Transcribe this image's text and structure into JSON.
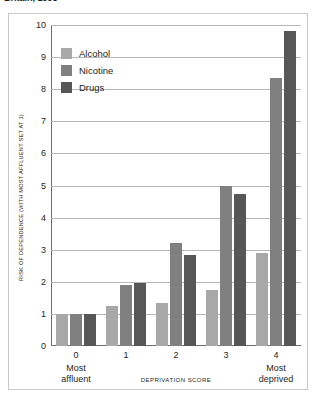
{
  "caption": {
    "text": "Britain, 1998"
  },
  "legend": {
    "position": "top-left-inside",
    "items": [
      {
        "label": "Alcohol",
        "color": "#a8a8a8",
        "icon": "square-swatch-icon"
      },
      {
        "label": "Nicotine",
        "color": "#808080",
        "icon": "square-swatch-icon"
      },
      {
        "label": "Drugs",
        "color": "#575757",
        "icon": "square-swatch-icon"
      }
    ]
  },
  "axes": {
    "y_title": "RISK OF DEPENDENCE (WITH MOST AFFLUENT SET AT 1)",
    "x_title": "DEPRIVATION SCORE",
    "y_ticks": [
      "0",
      "1",
      "2",
      "3",
      "4",
      "5",
      "6",
      "7",
      "8",
      "9",
      "10"
    ],
    "x_ticks": [
      {
        "value": "0",
        "sub": "Most\naffluent"
      },
      {
        "value": "1",
        "sub": ""
      },
      {
        "value": "2",
        "sub": ""
      },
      {
        "value": "3",
        "sub": ""
      },
      {
        "value": "4",
        "sub": "Most\ndeprived"
      }
    ],
    "x_tick_0_sub_line1": "Most",
    "x_tick_0_sub_line2": "affluent",
    "x_tick_4_sub_line1": "Most",
    "x_tick_4_sub_line2": "deprived"
  },
  "chart_data": {
    "type": "bar",
    "title": "Britain, 1998",
    "xlabel": "DEPRIVATION SCORE",
    "ylabel": "RISK OF DEPENDENCE (WITH MOST AFFLUENT SET AT 1)",
    "categories": [
      "0",
      "1",
      "2",
      "3",
      "4"
    ],
    "category_notes": [
      "Most affluent",
      "",
      "",
      "",
      "Most deprived"
    ],
    "series": [
      {
        "name": "Alcohol",
        "color": "#a8a8a8",
        "values": [
          1.0,
          1.25,
          1.35,
          1.75,
          2.9
        ]
      },
      {
        "name": "Nicotine",
        "color": "#808080",
        "values": [
          1.0,
          1.9,
          3.2,
          5.0,
          8.35
        ]
      },
      {
        "name": "Drugs",
        "color": "#575757",
        "values": [
          1.0,
          1.95,
          2.85,
          4.75,
          9.8
        ]
      }
    ],
    "ylim": [
      0,
      10
    ],
    "ytick_step": 1,
    "grid": "horizontal",
    "legend_position": "top-left-inside"
  }
}
